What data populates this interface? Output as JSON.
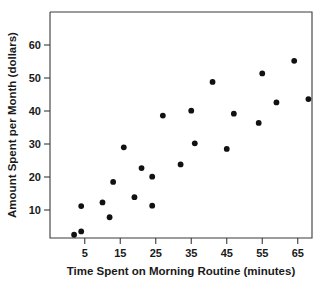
{
  "chart_data": {
    "type": "scatter",
    "title": "",
    "xlabel": "Time Spent on Morning Routine (minutes)",
    "ylabel": "Amount Spent per Month (dollars)",
    "xlim": [
      0,
      70
    ],
    "ylim": [
      0,
      68
    ],
    "grid": false,
    "legend": "none",
    "xticks": [
      5,
      15,
      25,
      35,
      45,
      55,
      65
    ],
    "xtick_labels": [
      "5",
      "15",
      "25",
      "35",
      "45",
      "55",
      "65"
    ],
    "yticks": [
      10,
      20,
      30,
      40,
      50,
      60
    ],
    "ytick_labels": [
      "10",
      "20",
      "30",
      "40",
      "50",
      "60"
    ],
    "marker": "filled-circle",
    "marker_color": "#111111",
    "points": [
      {
        "x": 2,
        "y": 2.5
      },
      {
        "x": 4,
        "y": 3.5
      },
      {
        "x": 4,
        "y": 11.2
      },
      {
        "x": 10,
        "y": 12.3
      },
      {
        "x": 12,
        "y": 7.8
      },
      {
        "x": 13,
        "y": 18.5
      },
      {
        "x": 16,
        "y": 29.0
      },
      {
        "x": 19,
        "y": 13.9
      },
      {
        "x": 21,
        "y": 22.7
      },
      {
        "x": 24,
        "y": 11.3
      },
      {
        "x": 24,
        "y": 20.1
      },
      {
        "x": 27,
        "y": 38.6
      },
      {
        "x": 32,
        "y": 23.8
      },
      {
        "x": 35,
        "y": 40.1
      },
      {
        "x": 36,
        "y": 30.2
      },
      {
        "x": 41,
        "y": 48.8
      },
      {
        "x": 45,
        "y": 28.5
      },
      {
        "x": 47,
        "y": 39.2
      },
      {
        "x": 54,
        "y": 36.4
      },
      {
        "x": 55,
        "y": 51.4
      },
      {
        "x": 59,
        "y": 42.6
      },
      {
        "x": 64,
        "y": 55.2
      },
      {
        "x": 68,
        "y": 43.6
      }
    ]
  },
  "axes": {
    "x_title": "Time Spent on Morning Routine (minutes)",
    "y_title": "Amount Spent per Month (dollars)"
  }
}
